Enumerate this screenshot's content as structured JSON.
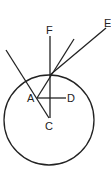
{
  "diagram": {
    "type": "geometry",
    "colors": {
      "line": "#222222",
      "background": "#ffffff"
    },
    "circle": {
      "cx": 49,
      "cy": 120,
      "r": 45
    },
    "points": {
      "A": {
        "x": 37,
        "y": 98,
        "label": "A"
      },
      "C": {
        "x": 49,
        "y": 118,
        "label": "C"
      },
      "D": {
        "x": 66,
        "y": 98,
        "label": "D"
      },
      "E": {
        "x": 106,
        "y": 28,
        "label": "E"
      },
      "F": {
        "x": 50,
        "y": 36,
        "label": "F"
      },
      "P": {
        "x": 50,
        "y": 75
      }
    },
    "labels": {
      "A": "A",
      "C": "C",
      "D": "D",
      "E": "E",
      "F": "F"
    },
    "segments": [
      {
        "name": "FC",
        "from": "F",
        "to": "C"
      },
      {
        "name": "AD",
        "from": "A",
        "to": "D"
      },
      {
        "name": "PE",
        "from": "P",
        "to": "E"
      },
      {
        "name": "A-through-P",
        "from": "A",
        "to": [
          74,
          39
        ]
      },
      {
        "name": "slanted-to-C",
        "from": [
          6,
          50
        ],
        "to": "C"
      }
    ]
  }
}
